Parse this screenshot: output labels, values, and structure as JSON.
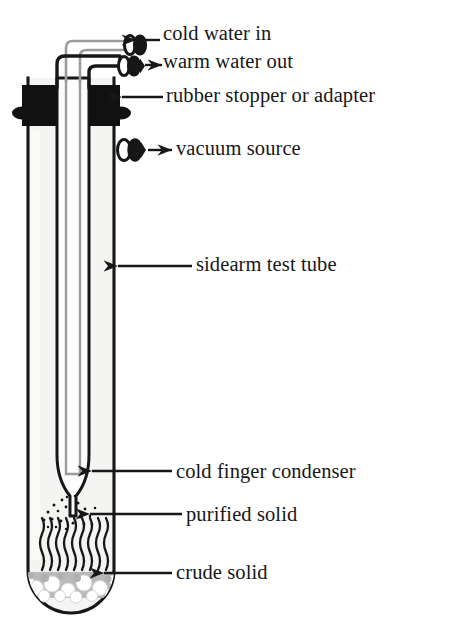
{
  "diagram": {
    "type": "laboratory-apparatus-schematic",
    "colors": {
      "ink": "#171717",
      "stopper": "#111111",
      "glass_fill": "#f4f4f2",
      "crude_solid": "#b9b9b9",
      "inner_tube": "#9b9b9b",
      "background": "#ffffff"
    },
    "labels": [
      {
        "id": "cold-water-in",
        "text": "cold water in",
        "arrow": "left"
      },
      {
        "id": "warm-water-out",
        "text": "warm water out",
        "arrow": "right"
      },
      {
        "id": "rubber-stopper",
        "text": "rubber stopper or adapter",
        "arrow": "left"
      },
      {
        "id": "vacuum-source",
        "text": "vacuum source",
        "arrow": "right"
      },
      {
        "id": "sidearm-test-tube",
        "text": "sidearm test tube",
        "arrow": "left"
      },
      {
        "id": "cold-finger",
        "text": "cold finger condenser",
        "arrow": "left"
      },
      {
        "id": "purified-solid",
        "text": "purified solid",
        "arrow": "left"
      },
      {
        "id": "crude-solid",
        "text": "crude solid",
        "arrow": "left"
      }
    ],
    "components": [
      {
        "id": "sidearm-test-tube",
        "name": "sidearm test tube"
      },
      {
        "id": "rubber-stopper",
        "name": "rubber stopper or adapter"
      },
      {
        "id": "cold-finger-condenser",
        "name": "cold finger condenser"
      },
      {
        "id": "cold-water-inlet-tube",
        "name": "cold water inlet tube"
      },
      {
        "id": "warm-water-outlet-tube",
        "name": "warm water outlet tube"
      },
      {
        "id": "vacuum-sidearm",
        "name": "vacuum sidearm hose barb"
      },
      {
        "id": "purified-solid-crystals",
        "name": "purified solid crystals"
      },
      {
        "id": "vapor-lines",
        "name": "subliming vapor"
      },
      {
        "id": "crude-solid-bed",
        "name": "crude solid"
      }
    ]
  }
}
